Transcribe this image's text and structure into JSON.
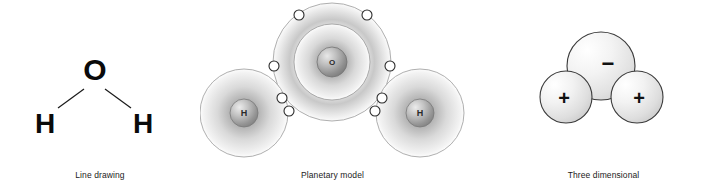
{
  "figure": {
    "background_color": "#ffffff"
  },
  "panels": [
    {
      "id": "line-drawing",
      "caption": "Line drawing",
      "atoms": [
        {
          "symbol": "O",
          "role": "oxygen"
        },
        {
          "symbol": "H",
          "role": "hydrogen-left"
        },
        {
          "symbol": "H",
          "role": "hydrogen-right"
        }
      ],
      "bonds": 2
    },
    {
      "id": "planetary",
      "caption": "Planetary model",
      "oxygen": {
        "symbol": "O",
        "shells": 2,
        "inner_shell_electrons": 2,
        "outer_shell_electrons": 6
      },
      "hydrogen_left": {
        "symbol": "H",
        "shells": 1,
        "shell_electrons": 1
      },
      "hydrogen_right": {
        "symbol": "H",
        "shells": 1,
        "shell_electrons": 1
      },
      "shared_electron_pairs": 2
    },
    {
      "id": "three-dimensional",
      "caption": "Three dimensional",
      "spheres": [
        {
          "label": "−",
          "role": "oxygen-partial-negative"
        },
        {
          "label": "+",
          "role": "hydrogen-partial-positive-left"
        },
        {
          "label": "+",
          "role": "hydrogen-partial-positive-right"
        }
      ]
    }
  ],
  "colors": {
    "stroke": "#2b2b2b",
    "shell_ring": "#9a9a9a",
    "text": "#1b1b1b",
    "electron_fill": "#ffffff"
  }
}
